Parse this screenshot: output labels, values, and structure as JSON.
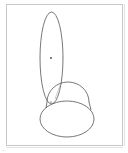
{
  "diagram": {
    "type": "geometric-sketch",
    "stroke_color": "#555555",
    "frame_color": "#c8c8c8",
    "background": "#ffffff",
    "shapes": [
      {
        "name": "tall-ellipse",
        "kind": "ellipse",
        "cx": 51.5,
        "cy": 58,
        "rx": 11.5,
        "ry": 46
      },
      {
        "name": "dome",
        "kind": "arc",
        "cx": 68,
        "cy": 101,
        "rx": 21,
        "ry": 19
      },
      {
        "name": "bottom-ellipse",
        "kind": "ellipse",
        "cx": 67,
        "cy": 119,
        "rx": 27,
        "ry": 18
      },
      {
        "name": "connector-line",
        "kind": "line",
        "x1": 61,
        "y1": 83,
        "x2": 55,
        "y2": 99
      }
    ],
    "points": [
      {
        "name": "center-point",
        "x": 51,
        "y": 58
      },
      {
        "name": "anchor-point",
        "x": 51,
        "y": 102
      }
    ]
  },
  "footer": {
    "corner_label": "..."
  }
}
